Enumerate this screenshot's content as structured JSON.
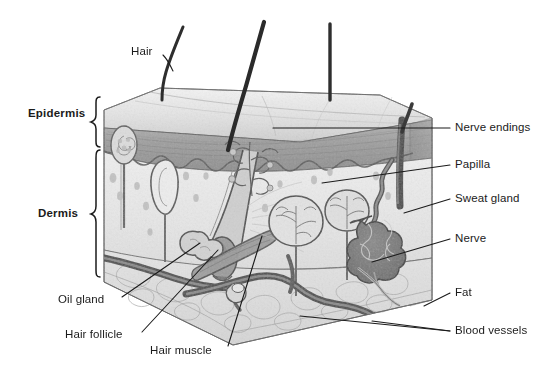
{
  "diagram": {
    "style": "pencil-shaded grayscale anatomical illustration",
    "background": "#ffffff",
    "ink_color": "#1b1b1b"
  },
  "layer_brackets": [
    {
      "id": "epidermis",
      "label": "Epidermis",
      "label_x": 28,
      "label_y": 114,
      "bracket_x": 96,
      "bracket_top": 97,
      "bracket_bottom": 149
    },
    {
      "id": "dermis",
      "label": "Dermis",
      "label_x": 38,
      "label_y": 214,
      "bracket_x": 96,
      "bracket_top": 150,
      "bracket_bottom": 277
    }
  ],
  "callouts": [
    {
      "id": "hair",
      "label": "Hair",
      "side": "top-left",
      "text_x": 131,
      "text_y": 52,
      "anchor_x": 163,
      "anchor_y": 55,
      "target_x": 172,
      "target_y": 70
    },
    {
      "id": "nerve-endings",
      "label": "Nerve endings",
      "side": "right",
      "text_x": 455,
      "text_y": 128,
      "anchor_x": 450,
      "anchor_y": 128,
      "target_x": 273,
      "target_y": 128
    },
    {
      "id": "papilla",
      "label": "Papilla",
      "side": "right",
      "text_x": 455,
      "text_y": 165,
      "anchor_x": 450,
      "anchor_y": 165,
      "target_x": 321,
      "target_y": 183
    },
    {
      "id": "sweat-gland",
      "label": "Sweat gland",
      "side": "right",
      "text_x": 455,
      "text_y": 199,
      "anchor_x": 450,
      "anchor_y": 199,
      "target_x": 412,
      "target_y": 213
    },
    {
      "id": "nerve",
      "label": "Nerve",
      "side": "right",
      "text_x": 455,
      "text_y": 239,
      "anchor_x": 450,
      "anchor_y": 239,
      "target_x": 372,
      "target_y": 262
    },
    {
      "id": "fat",
      "label": "Fat",
      "side": "right",
      "text_x": 455,
      "text_y": 293,
      "anchor_x": 450,
      "anchor_y": 293,
      "target_x": 427,
      "target_y": 306
    },
    {
      "id": "blood-vessels",
      "label": "Blood vessels",
      "side": "right",
      "text_x": 455,
      "text_y": 331,
      "anchor_x": 450,
      "anchor_y": 331,
      "target_x": 372,
      "target_y": 322
    },
    {
      "id": "oil-gland",
      "label": "Oil gland",
      "side": "bottom-left",
      "text_x": 58,
      "text_y": 300,
      "anchor_x": 122,
      "anchor_y": 297,
      "target_x": 200,
      "target_y": 244
    },
    {
      "id": "hair-follicle",
      "label": "Hair follicle",
      "side": "bottom-left",
      "text_x": 65,
      "text_y": 335,
      "anchor_x": 142,
      "anchor_y": 332,
      "target_x": 215,
      "target_y": 253
    },
    {
      "id": "hair-muscle",
      "label": "Hair muscle",
      "side": "bottom-left",
      "text_x": 150,
      "text_y": 351,
      "anchor_x": 228,
      "anchor_y": 346,
      "target_x": 263,
      "target_y": 237
    }
  ],
  "anatomy_notes": {
    "block": "rectangular 3D slab of skin drawn in perspective",
    "hairs": 3,
    "structures": [
      "hair shaft",
      "hair follicle",
      "oil gland",
      "hair muscle",
      "nerve endings",
      "papilla",
      "sweat gland coil",
      "nerve",
      "fat lobules",
      "blood vessels"
    ]
  }
}
